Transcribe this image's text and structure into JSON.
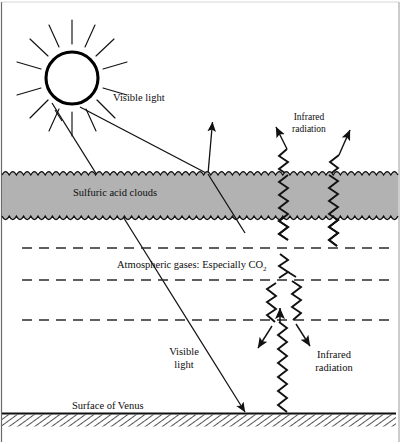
{
  "figure": {
    "width": 401,
    "height": 444
  },
  "colors": {
    "ink": "#0d0d0d",
    "cloud_fill": "#b2b2b2",
    "cloud_stroke": "#111111",
    "dashed_line": "#2b2b2b",
    "surface_hatch": "#1a1a1a",
    "background": "#ffffff",
    "frame": "#555555"
  },
  "labels": {
    "visible_light_top": "Visible light",
    "infrared_radiation_top_line1": "Infrared",
    "infrared_radiation_top_line2": "radiation",
    "sulfuric_acid_clouds": "Sulfuric acid clouds",
    "atmospheric_gases": "Atmospheric gases:  Especially CO",
    "atmospheric_gases_subscript": "2",
    "visible_light_bottom_line1": "Visible",
    "visible_light_bottom_line2": "light",
    "infrared_radiation_bottom_line1": "Infrared",
    "infrared_radiation_bottom_line2": "radiation",
    "surface_of_venus": "Surface of Venus"
  },
  "layers": {
    "cloud_band": {
      "name": "Sulfuric acid cloud layer",
      "top_y": 172,
      "bottom_y": 219
    },
    "gas_lines_y": [
      248,
      280,
      320
    ],
    "surface_y": 414
  },
  "elements": {
    "sun": {
      "name": "sun",
      "cx": 72,
      "cy": 78,
      "r": 26,
      "ray_count": 16
    },
    "rays": [
      {
        "name": "incoming-visible-ray-reflected",
        "kind": "visible-light",
        "from": [
          78,
          108
        ],
        "to": [
          208,
          174
        ]
      },
      {
        "name": "reflected-visible-ray",
        "kind": "visible-light",
        "from": [
          208,
          174
        ],
        "to": [
          212,
          121
        ]
      },
      {
        "name": "incoming-visible-ray-to-surface",
        "kind": "visible-light",
        "from": [
          52,
          104
        ],
        "to": [
          245,
          414
        ]
      }
    ],
    "infrared_upper": [
      {
        "name": "infrared-wave-upper-left",
        "direction": "up",
        "x": 281
      },
      {
        "name": "infrared-wave-upper-right",
        "direction": "up",
        "x": 335
      }
    ],
    "infrared_lower": [
      {
        "name": "infrared-wave-surface-up",
        "direction": "up",
        "x": 285
      },
      {
        "name": "infrared-wave-reradiated-left",
        "direction": "down-left",
        "x": 268
      },
      {
        "name": "infrared-wave-reradiated-right",
        "direction": "down-right",
        "x": 302
      }
    ]
  }
}
